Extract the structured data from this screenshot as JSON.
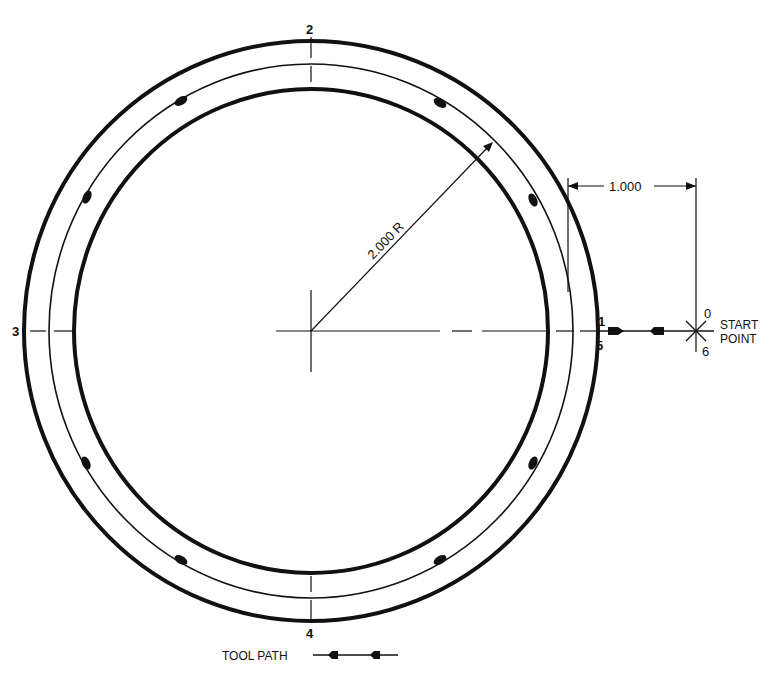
{
  "figure": {
    "type": "machining tool path diagram",
    "colors": {
      "ink": "#111111",
      "paper": "#ffffff"
    },
    "part": {
      "radius_label": "2.000 R",
      "offset_label": "1.000"
    },
    "points": {
      "p0": "0",
      "p1": "1",
      "p2": "2",
      "p3": "3",
      "p4": "4",
      "p5": "5",
      "p6": "6"
    },
    "start_point": {
      "line1": "START",
      "line2": "POINT"
    },
    "legend": {
      "label": "TOOL PATH",
      "symbol": "tool-path-arrow"
    },
    "tool_path": {
      "direction": "counterclockwise",
      "sequence": [
        "0",
        "1",
        "2",
        "3",
        "4",
        "5",
        "6"
      ]
    }
  }
}
